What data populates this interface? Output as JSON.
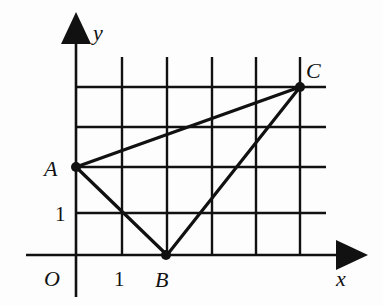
{
  "figure": {
    "type": "coordinate-grid-triangle",
    "axes": {
      "x_label": "x",
      "y_label": "y",
      "origin_label": "O",
      "x_tick_label": "1",
      "y_tick_label": "1"
    },
    "grid": {
      "x_lines": [
        1,
        2,
        3,
        4,
        5
      ],
      "y_lines": [
        1,
        2,
        3,
        4
      ],
      "unit": 1
    },
    "points": [
      {
        "name": "A",
        "x": 0,
        "y": 2
      },
      {
        "name": "B",
        "x": 2,
        "y": 0
      },
      {
        "name": "C",
        "x": 5,
        "y": 4
      }
    ],
    "triangle": [
      "A",
      "B",
      "C"
    ],
    "colors": {
      "line": "#111111",
      "background": "#fdfdfd"
    }
  },
  "labels": {
    "A": "A",
    "B": "B",
    "C": "C",
    "O": "O",
    "x": "x",
    "y": "y",
    "tick_x1": "1",
    "tick_y1": "1"
  }
}
